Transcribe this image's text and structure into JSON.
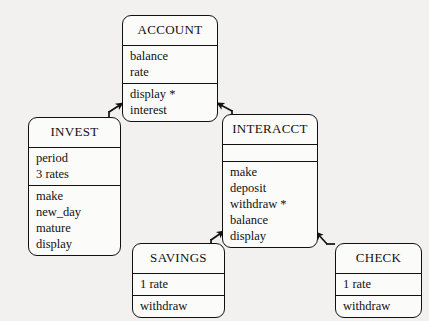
{
  "diagram": {
    "type": "class-inheritance-diagram",
    "background_color": "#f2f1ef",
    "line_color": "#111111",
    "box_fill_color": "#fbfbfa",
    "classes": [
      {
        "id": "account",
        "name": "ACCOUNT",
        "attributes": [
          "balance",
          "rate"
        ],
        "operations": [
          "display *",
          "interest"
        ]
      },
      {
        "id": "invest",
        "name": "INVEST",
        "attributes": [
          "period",
          "3 rates"
        ],
        "operations": [
          "make",
          "new_day",
          "mature",
          "display"
        ]
      },
      {
        "id": "interacct",
        "name": "INTERACCT",
        "attributes": [],
        "operations": [
          "make",
          "deposit",
          "withdraw *",
          "balance",
          "display"
        ]
      },
      {
        "id": "savings",
        "name": "SAVINGS",
        "attributes": [
          "1 rate"
        ],
        "operations": [
          "withdraw"
        ]
      },
      {
        "id": "check",
        "name": "CHECK",
        "attributes": [
          "1 rate"
        ],
        "operations": [
          "withdraw"
        ]
      }
    ],
    "edges": [
      {
        "id": "invest-to-account",
        "from": "INVEST",
        "to": "ACCOUNT",
        "arrow": "solid-filled"
      },
      {
        "id": "interacct-to-account",
        "from": "INTERACCT",
        "to": "ACCOUNT",
        "arrow": "solid-filled"
      },
      {
        "id": "savings-to-interacct",
        "from": "SAVINGS",
        "to": "INTERACCT",
        "arrow": "solid-filled"
      },
      {
        "id": "check-to-interacct",
        "from": "CHECK",
        "to": "INTERACCT",
        "arrow": "solid-filled"
      }
    ]
  }
}
